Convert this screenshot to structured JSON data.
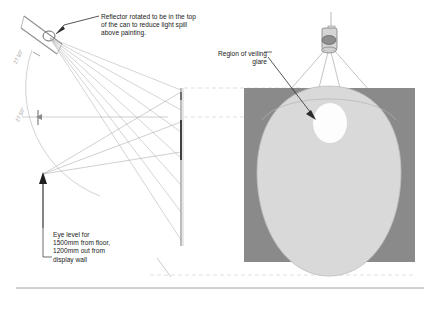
{
  "diagram": {
    "title_visible": false,
    "annotations": {
      "reflector_note": "Reflector rotated to be in the top\nof the can to reduce light spill\nabove painting.",
      "veiling_note": "Region of veiling\nglare",
      "eye_level_note": "Eye level for\n1500mm from floor,\n1200mm out from\ndisplay wall"
    },
    "dimensions": {
      "upper_angle": "27.50°",
      "lower_angle": "27.50°"
    },
    "colors": {
      "wall_gray": "#8a8a8a",
      "light_pool": "#d8d8d8",
      "glare_spot": "#ffffff",
      "line": "#9a9a9a",
      "dark_line": "#2b2b2b",
      "text": "#1a1a1a",
      "dim_text": "#9a9a9a"
    },
    "left_view": {
      "name": "section-elevation",
      "elements": [
        "luminaire-can",
        "reflector-circle",
        "light-ray-fan",
        "angle-arc",
        "display-wall",
        "painting-segment",
        "eye-point-arrow"
      ]
    },
    "right_view": {
      "name": "front-elevation",
      "elements": [
        "ceiling-mounted-can",
        "beam-cone",
        "wall-rectangle",
        "light-pool-oval",
        "veiling-glare-spot"
      ]
    }
  }
}
